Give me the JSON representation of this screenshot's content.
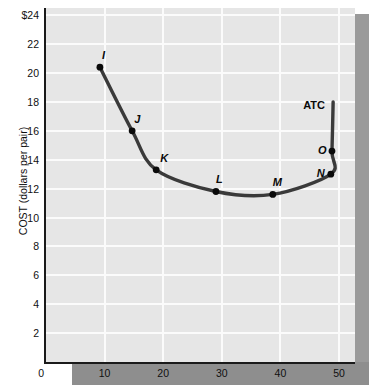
{
  "chart_data": {
    "type": "line",
    "title": "",
    "xlabel": "",
    "ylabel": "COST (dollars per pair)",
    "series_label": "ATC",
    "xlim": [
      0,
      52.5
    ],
    "ylim": [
      0,
      24.5
    ],
    "xticks": [
      0,
      10,
      20,
      30,
      40,
      50
    ],
    "xtick_labels": [
      "0",
      "10",
      "20",
      "30",
      "40",
      "50"
    ],
    "yticks": [
      2,
      4,
      6,
      8,
      10,
      12,
      14,
      16,
      18,
      20,
      22,
      24
    ],
    "ytick_labels": [
      "2",
      "4",
      "6",
      "8",
      "10",
      "12",
      "14",
      "16",
      "18",
      "20",
      "22",
      "$24"
    ],
    "grid": true,
    "legend_position": "inline-right",
    "points": [
      {
        "label": "I",
        "x": 9.2,
        "y": 20.4
      },
      {
        "label": "J",
        "x": 14.7,
        "y": 16.0
      },
      {
        "label": "K",
        "x": 18.8,
        "y": 13.3
      },
      {
        "label": "L",
        "x": 29.0,
        "y": 11.8
      },
      {
        "label": "M",
        "x": 38.7,
        "y": 11.6
      },
      {
        "label": "N",
        "x": 48.6,
        "y": 13.0
      },
      {
        "label": "O",
        "x": 48.8,
        "y": 14.6
      }
    ],
    "x": [
      9.2,
      14.7,
      18.8,
      29.0,
      38.7,
      48.6,
      48.8,
      49.0
    ],
    "y": [
      20.4,
      16.0,
      13.3,
      11.8,
      11.6,
      13.0,
      14.6,
      18.0
    ],
    "line_color": "#3a3a3a",
    "marker_color": "#0a0a0a",
    "panel_color": "#e6e6e6",
    "grid_color": "#fbfbfb"
  },
  "axis": {
    "y_title": "COST (dollars per pair)"
  }
}
